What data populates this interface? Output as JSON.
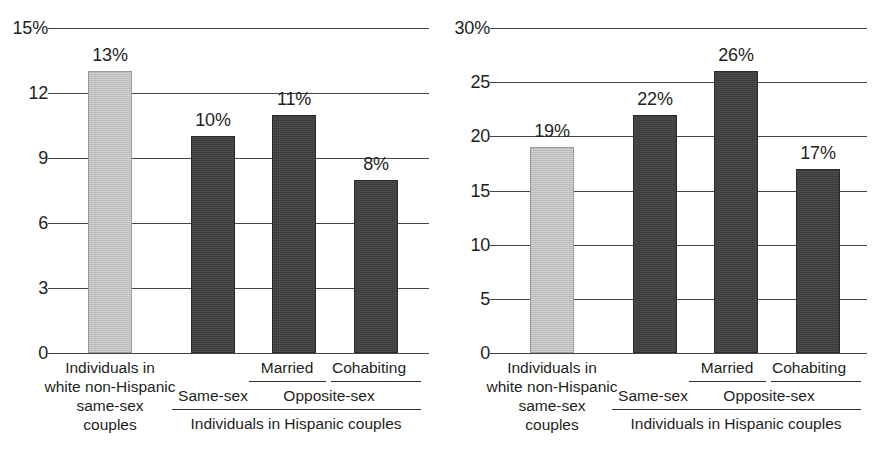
{
  "figure": {
    "background": "#ffffff",
    "panel_count": 2,
    "colors": {
      "light_bar": "#bfbfbf",
      "dark_bar": "#383838",
      "axis": "#41464a",
      "text": "#1d1f21"
    }
  },
  "chart_data": [
    {
      "type": "bar",
      "panel": "left",
      "title": "",
      "xlabel": "",
      "ylabel": "",
      "ylim": [
        0,
        15
      ],
      "yticks": [
        0,
        3,
        6,
        9,
        12,
        15
      ],
      "ytick_labels": [
        "0",
        "3",
        "6",
        "9",
        "12",
        "15%"
      ],
      "grid": true,
      "legend": "none",
      "categories": [
        "Individuals in white non-Hispanic same-sex couples",
        "Same-sex",
        "Married",
        "Cohabiting"
      ],
      "values": [
        13,
        10,
        11,
        8
      ],
      "data_labels": [
        "13%",
        "10%",
        "11%",
        "8%"
      ],
      "bar_colors": [
        "#bfbfbf",
        "#383838",
        "#383838",
        "#383838"
      ],
      "group_labels": {
        "reference": "Individuals in white non-Hispanic same-sex couples",
        "same_sex": "Same-sex",
        "opposite_sex": "Opposite-sex",
        "married": "Married",
        "cohabiting": "Cohabiting",
        "hispanic": "Individuals in Hispanic couples"
      }
    },
    {
      "type": "bar",
      "panel": "right",
      "title": "",
      "xlabel": "",
      "ylabel": "",
      "ylim": [
        0,
        30
      ],
      "yticks": [
        0,
        5,
        10,
        15,
        20,
        25,
        30
      ],
      "ytick_labels": [
        "0",
        "5",
        "10",
        "15",
        "20",
        "25",
        "30%"
      ],
      "grid": true,
      "legend": "none",
      "categories": [
        "Individuals in white non-Hispanic same-sex couples",
        "Same-sex",
        "Married",
        "Cohabiting"
      ],
      "values": [
        19,
        22,
        26,
        17
      ],
      "data_labels": [
        "19%",
        "22%",
        "26%",
        "17%"
      ],
      "bar_colors": [
        "#bfbfbf",
        "#383838",
        "#383838",
        "#383838"
      ],
      "group_labels": {
        "reference": "Individuals in white non-Hispanic same-sex couples",
        "same_sex": "Same-sex",
        "opposite_sex": "Opposite-sex",
        "married": "Married",
        "cohabiting": "Cohabiting",
        "hispanic": "Individuals in Hispanic couples"
      }
    }
  ],
  "left": {
    "yticks": [
      {
        "label": "15%",
        "value": 15
      },
      {
        "label": "12",
        "value": 12
      },
      {
        "label": "9",
        "value": 9
      },
      {
        "label": "6",
        "value": 6
      },
      {
        "label": "3",
        "value": 3
      },
      {
        "label": "0",
        "value": 0
      }
    ],
    "bars": [
      {
        "label": "13%",
        "value": 13,
        "shade": "light"
      },
      {
        "label": "10%",
        "value": 10,
        "shade": "dark"
      },
      {
        "label": "11%",
        "value": 11,
        "shade": "dark"
      },
      {
        "label": "8%",
        "value": 8,
        "shade": "dark"
      }
    ],
    "labels": {
      "reference_line1": "Individuals in",
      "reference_line2": "white non-Hispanic",
      "reference_line3": "same-sex",
      "reference_line4": "couples",
      "married": "Married",
      "cohabiting": "Cohabiting",
      "same_sex": "Same-sex",
      "opposite_sex": "Opposite-sex",
      "hispanic": "Individuals in Hispanic couples"
    }
  },
  "right": {
    "yticks": [
      {
        "label": "30%",
        "value": 30
      },
      {
        "label": "25",
        "value": 25
      },
      {
        "label": "20",
        "value": 20
      },
      {
        "label": "15",
        "value": 15
      },
      {
        "label": "10",
        "value": 10
      },
      {
        "label": "5",
        "value": 5
      },
      {
        "label": "0",
        "value": 0
      }
    ],
    "bars": [
      {
        "label": "19%",
        "value": 19,
        "shade": "light"
      },
      {
        "label": "22%",
        "value": 22,
        "shade": "dark"
      },
      {
        "label": "26%",
        "value": 26,
        "shade": "dark"
      },
      {
        "label": "17%",
        "value": 17,
        "shade": "dark"
      }
    ],
    "labels": {
      "reference_line1": "Individuals in",
      "reference_line2": "white non-Hispanic",
      "reference_line3": "same-sex",
      "reference_line4": "couples",
      "married": "Married",
      "cohabiting": "Cohabiting",
      "same_sex": "Same-sex",
      "opposite_sex": "Opposite-sex",
      "hispanic": "Individuals in Hispanic couples"
    }
  }
}
